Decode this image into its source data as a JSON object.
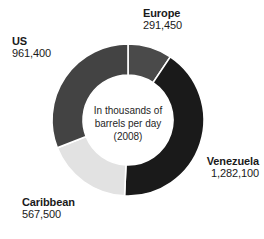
{
  "chart_data": {
    "type": "pie",
    "variant": "donut",
    "title": "",
    "subtitle": "",
    "center_note_lines": [
      "In thousands of",
      "barrels per day",
      "(2008)"
    ],
    "units": "thousands of barrels per day",
    "year": "2008",
    "categories": [
      "Europe",
      "Venezuela",
      "Caribbean",
      "US"
    ],
    "values": [
      291450,
      1282100,
      567500,
      961400
    ],
    "value_labels": [
      "291,450",
      "1,282,100",
      "567,500",
      "961,400"
    ],
    "total": 3102450,
    "start_angle_deg": 0,
    "direction": "clockwise",
    "slices": [
      {
        "label": "Europe",
        "value": 291450,
        "value_label": "291,450",
        "color": "#4a4a4a",
        "start_deg": 0.0,
        "end_deg": 33.8,
        "percent": 9.4
      },
      {
        "label": "Venezuela",
        "value": 1282100,
        "value_label": "1,282,100",
        "color": "#1a1a1a",
        "start_deg": 33.8,
        "end_deg": 182.6,
        "percent": 41.3
      },
      {
        "label": "Caribbean",
        "value": 567500,
        "value_label": "567,500",
        "color": "#e2e2e2",
        "start_deg": 182.6,
        "end_deg": 248.5,
        "percent": 18.3
      },
      {
        "label": "US",
        "value": 961400,
        "value_label": "961,400",
        "color": "#434343",
        "start_deg": 248.5,
        "end_deg": 360.0,
        "percent": 31.0
      }
    ],
    "legend_position": "callouts",
    "grid": false,
    "background_color": "#ffffff",
    "text_color": "#1a1a1a",
    "separator_color": "#ffffff"
  },
  "labels": {
    "europe": {
      "category": "Europe",
      "value": "291,450"
    },
    "us": {
      "category": "US",
      "value": "961,400"
    },
    "venezuela": {
      "category": "Venezuela",
      "value": "1,282,100"
    },
    "caribbean": {
      "category": "Caribbean",
      "value": "567,500"
    }
  },
  "center": {
    "line1": "In thousands of",
    "line2": "barrels per day",
    "line3": "(2008)"
  }
}
